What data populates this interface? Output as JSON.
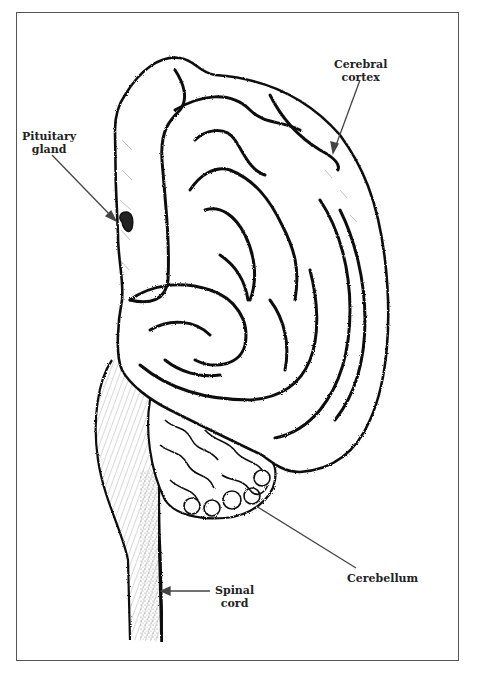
{
  "diagram": {
    "labels": [
      {
        "id": "pituitary",
        "text_line1": "Pituitary",
        "text_line2": "gland"
      },
      {
        "id": "cortex",
        "text_line1": "Cerebral",
        "text_line2": "cortex"
      },
      {
        "id": "cerebellum",
        "text_line1": "Cerebellum",
        "text_line2": ""
      },
      {
        "id": "spinal",
        "text_line1": "Spinal",
        "text_line2": "cord"
      }
    ],
    "colors": {
      "ink": "#111111",
      "leader": "#444444",
      "frame": "#555555",
      "paper": "#ffffff"
    }
  }
}
